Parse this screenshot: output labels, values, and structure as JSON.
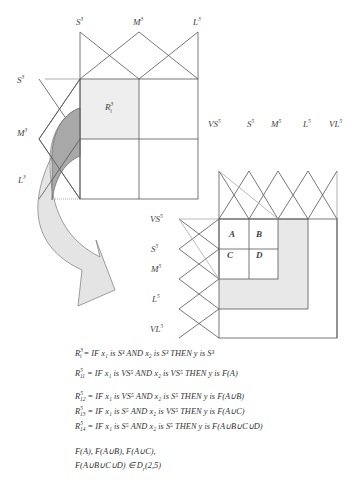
{
  "top_grid": {
    "x_labels": [
      "S",
      "M",
      "L"
    ],
    "x_label_sup": "3",
    "y_labels": [
      "S",
      "M",
      "L"
    ],
    "y_label_sup": "3",
    "cell_label": "R",
    "cell_label_sup": "3",
    "cell_label_sub": "i"
  },
  "middle_labels": {
    "items": [
      "VS",
      "S",
      "M",
      "L",
      "VL"
    ],
    "sup": "5"
  },
  "bottom_grid": {
    "y_labels": [
      "VS",
      "S",
      "M",
      "L",
      "VL"
    ],
    "y_label_sup": "5",
    "cells": [
      "A",
      "B",
      "C",
      "D"
    ]
  },
  "rules": [
    {
      "lhs": "R",
      "sup": "3",
      "sub": "i",
      "text": " = IF x₁ is S³ AND x₂ is S³ THEN y is S³"
    },
    {
      "lhs": "R",
      "sup": "5",
      "sub": "11",
      "text": " = IF x₁ is VS⁵ AND x₂ is VS⁵ THEN y is F(A)"
    },
    {
      "lhs": "R",
      "sup": "5",
      "sub": "12",
      "text": " = IF x₁ is VS⁵ AND x₂ is S⁵ THEN y is F(A∪B)"
    },
    {
      "lhs": "R",
      "sup": "5",
      "sub": "13",
      "text": " = IF x₁ is S⁵ AND x₂ is VS⁵ THEN y is F(A∪C)"
    },
    {
      "lhs": "R",
      "sup": "5",
      "sub": "14",
      "text": " = IF x₁ is S⁵ AND x₂ is S⁵ THEN y is F(A∪B∪C∪D)"
    }
  ],
  "conclusion": {
    "line1": "F(A), F(A∪B), F(A∪C),",
    "line2": "F(A∪B∪C∪D) ∈ D",
    "line2_sub": "r",
    "line2_tail": "(2,5)"
  },
  "colors": {
    "line": "#555555",
    "light_line": "#aaaaaa",
    "shade": "#e6e6e6",
    "arrow_dark": "#a9a9a9",
    "arrow_light": "#e2e2e2"
  }
}
